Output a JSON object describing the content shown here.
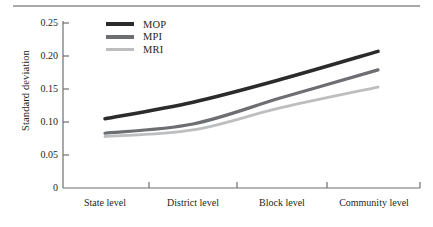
{
  "chart_data": {
    "type": "line",
    "title": "",
    "xlabel": "",
    "ylabel": "Standard deviation",
    "categories": [
      "State level",
      "District level",
      "Block level",
      "Community level"
    ],
    "ylim": [
      0,
      0.25
    ],
    "yticks": [
      "0",
      "0.05",
      "0.10",
      "0.15",
      "0.20",
      "0.25"
    ],
    "ytick_values": [
      0,
      0.05,
      0.1,
      0.15,
      0.2,
      0.25
    ],
    "grid": false,
    "legend_position": "top-left-inside",
    "series": [
      {
        "name": "MOP",
        "color": "#2b2b2b",
        "values": [
          0.105,
          0.13,
          0.165,
          0.207
        ]
      },
      {
        "name": "MPI",
        "color": "#6d6e71",
        "values": [
          0.083,
          0.097,
          0.137,
          0.179
        ]
      },
      {
        "name": "MRI",
        "color": "#bcbec0",
        "values": [
          0.078,
          0.088,
          0.122,
          0.153
        ]
      }
    ]
  },
  "axis": {
    "color": "#6d6e71",
    "rule_color": "#a7a9ac"
  }
}
